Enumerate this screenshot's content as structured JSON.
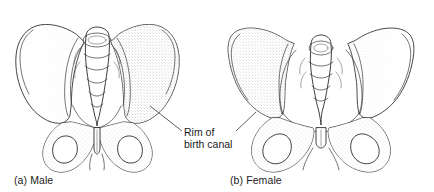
{
  "figure": {
    "background_color": "#ffffff",
    "ink_color": "#2b2b2b",
    "panels": [
      {
        "id": "male",
        "caption": "(a) Male",
        "subject": "male-pelvis",
        "traits": "narrow subpubic angle, heart-shaped pelvic inlet, narrow pelvic brim"
      },
      {
        "id": "female",
        "caption": "(b) Female",
        "subject": "female-pelvis",
        "traits": "wide subpubic angle, oval pelvic inlet, broad flared ilia"
      }
    ],
    "annotation": {
      "line_1": "Rim of",
      "line_2": "birth canal",
      "full_text": "Rim of birth canal",
      "leader_count": 2
    }
  }
}
